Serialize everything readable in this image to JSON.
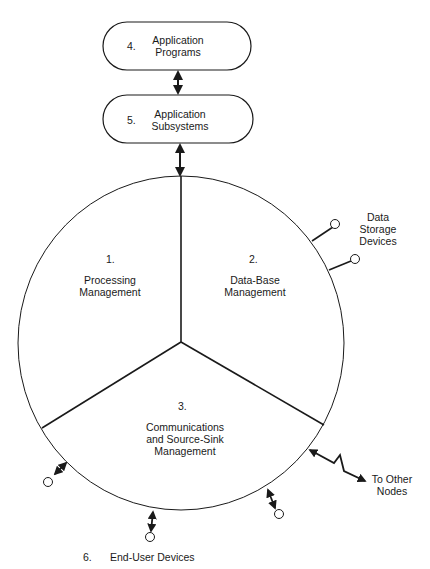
{
  "diagram": {
    "boxes": [
      {
        "number": "4.",
        "line1": "Application",
        "line2": "Programs"
      },
      {
        "number": "5.",
        "line1": "Application",
        "line2": "Subsystems"
      }
    ],
    "sectors": [
      {
        "number": "1.",
        "line1": "Processing",
        "line2": "Management"
      },
      {
        "number": "2.",
        "line1": "Data-Base",
        "line2": "Management"
      },
      {
        "number": "3.",
        "line1": "Communications",
        "line2": "and Source-Sink",
        "line3": "Management"
      }
    ],
    "external": {
      "storage": {
        "line1": "Data",
        "line2": "Storage",
        "line3": "Devices"
      },
      "nodes": {
        "line1": "To Other",
        "line2": "Nodes"
      },
      "end_user": {
        "number": "6.",
        "label": "End-User Devices"
      }
    }
  }
}
